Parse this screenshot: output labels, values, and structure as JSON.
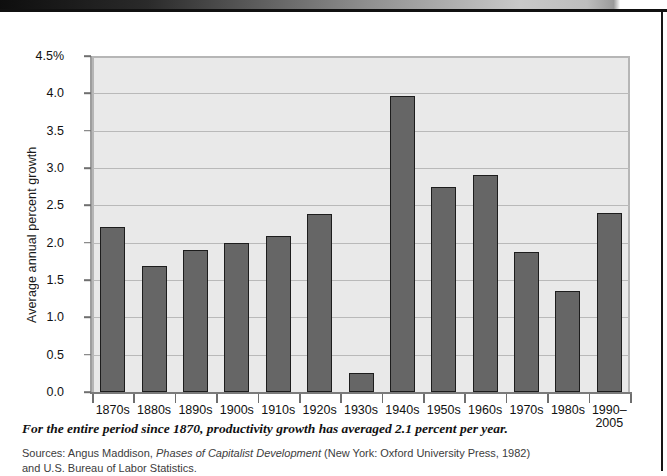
{
  "chart_data": {
    "type": "bar",
    "title": "",
    "xlabel": "",
    "ylabel": "Average annual percent growth",
    "ylim": [
      0.0,
      4.5
    ],
    "ytick_values": [
      0.0,
      0.5,
      1.0,
      1.5,
      2.0,
      2.5,
      3.0,
      3.5,
      4.0,
      4.5
    ],
    "ytick_labels": [
      "0.0",
      "0.5",
      "1.0",
      "1.5",
      "2.0",
      "2.5",
      "3.0",
      "3.5",
      "4.0",
      "4.5%"
    ],
    "grid": true,
    "legend": null,
    "categories": [
      "1870s",
      "1880s",
      "1890s",
      "1900s",
      "1910s",
      "1920s",
      "1930s",
      "1940s",
      "1950s",
      "1960s",
      "1970s",
      "1980s",
      "1990–\n2005"
    ],
    "values": [
      2.21,
      1.69,
      1.9,
      2.0,
      2.09,
      2.38,
      0.25,
      3.97,
      2.75,
      2.9,
      1.87,
      1.35,
      2.4
    ],
    "bar_color": "#666666",
    "bar_edge_color": "#1d1d1d",
    "plot_background": "#e9e9e9"
  },
  "caption": {
    "text": "For the entire period since 1870, productivity growth has averaged 2.1 percent per year."
  },
  "sources": {
    "line1_prefix": "Sources: Angus Maddison, ",
    "line1_italic": "Phases of Capitalist Development",
    "line1_suffix": " (New York: Oxford University Press, 1982)",
    "line2": "and U.S. Bureau of Labor Statistics."
  }
}
